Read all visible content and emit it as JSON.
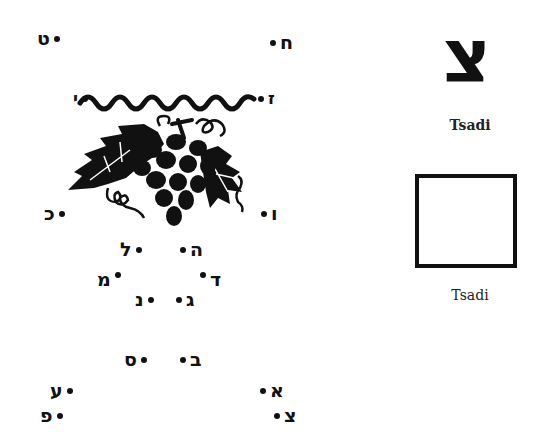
{
  "puzzle": {
    "points": [
      {
        "id": "tet",
        "letter": "ט"
      },
      {
        "id": "het",
        "letter": "ח"
      },
      {
        "id": "zayin",
        "letter": "ז"
      },
      {
        "id": "yod",
        "letter": "י"
      },
      {
        "id": "vav",
        "letter": "ו"
      },
      {
        "id": "kaf",
        "letter": "כ"
      },
      {
        "id": "he",
        "letter": "ה"
      },
      {
        "id": "lamed",
        "letter": "ל"
      },
      {
        "id": "dalet",
        "letter": "ד"
      },
      {
        "id": "mem",
        "letter": "מ"
      },
      {
        "id": "gimel",
        "letter": "ג"
      },
      {
        "id": "nun",
        "letter": "נ"
      },
      {
        "id": "bet",
        "letter": "ב"
      },
      {
        "id": "samekh",
        "letter": "ס"
      },
      {
        "id": "alef",
        "letter": "א"
      },
      {
        "id": "ayin",
        "letter": "ע"
      },
      {
        "id": "tsadi",
        "letter": "צ"
      },
      {
        "id": "pe",
        "letter": "פ"
      }
    ],
    "illustration": "grape-cluster"
  },
  "card": {
    "letter": "צ",
    "caption": "Tsadi"
  },
  "practice": {
    "caption": "Tsadi"
  }
}
